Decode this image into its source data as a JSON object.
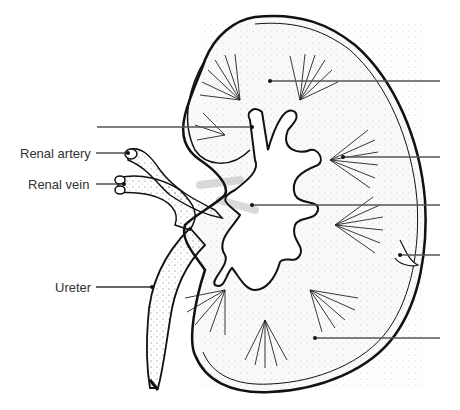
{
  "diagram": {
    "labels": [
      {
        "id": "renal-artery",
        "text": "Renal artery",
        "x": 20,
        "y": 148
      },
      {
        "id": "renal-vein",
        "text": "Renal vein",
        "x": 28,
        "y": 179
      },
      {
        "id": "ureter",
        "text": "Ureter",
        "x": 55,
        "y": 280
      }
    ],
    "blank_leader_lines": [
      {
        "id": "blank-1",
        "side": "right",
        "y": 81,
        "x1": 270,
        "x2": 440
      },
      {
        "id": "blank-2",
        "side": "left",
        "y": 127,
        "x1": 97,
        "x2": 252
      },
      {
        "id": "blank-3",
        "side": "right",
        "y": 157,
        "x1": 343,
        "x2": 440
      },
      {
        "id": "blank-4",
        "side": "right",
        "y": 205,
        "x1": 252,
        "x2": 440
      },
      {
        "id": "blank-5",
        "side": "right",
        "y": 255,
        "x1": 400,
        "x2": 440
      },
      {
        "id": "blank-6",
        "side": "right",
        "y": 338,
        "x1": 315,
        "x2": 440
      }
    ],
    "colors": {
      "line": "#555555",
      "ink": "#111111",
      "text": "#333333",
      "background": "#ffffff"
    }
  }
}
